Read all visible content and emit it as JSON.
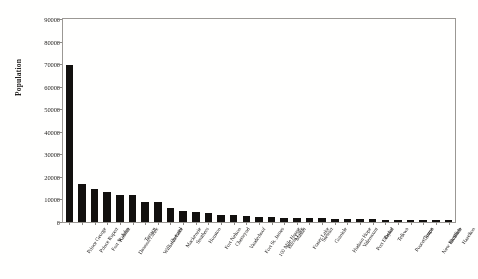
{
  "chart_data": {
    "type": "bar",
    "title": "",
    "xlabel": "",
    "ylabel": "Population",
    "ylim": [
      0,
      90000
    ],
    "yticks": [
      0,
      10000,
      20000,
      30000,
      40000,
      50000,
      60000,
      70000,
      80000,
      90000
    ],
    "grid": false,
    "legend": null,
    "bar_color": "#141210",
    "categories": [
      "Prince George",
      "Prince Rupert",
      "Fort St. John",
      "Kitimat",
      "Dawson Creek",
      "Terrace",
      "Williams Lake",
      "Quesnel",
      "Mackenzie",
      "Smithers",
      "Houston",
      "Fort Nelson",
      "Chetwynd",
      "Vanderhoof",
      "Fort St. James",
      "100 Mile House",
      "Burns Lake",
      "Masset",
      "Fraser Lake",
      "Stewart",
      "Granisle",
      "Hudson Hope",
      "Valemount",
      "Port Edward",
      "Taylor",
      "Telkwa",
      "Pouce Coupe",
      "Clinton",
      "New Hazelton",
      "McBride",
      "Hazelton"
    ],
    "values": [
      69500,
      16800,
      14600,
      13500,
      12000,
      11800,
      9000,
      8900,
      6300,
      5100,
      4300,
      4200,
      3100,
      2900,
      2500,
      2300,
      2200,
      2000,
      1800,
      1700,
      1600,
      1400,
      1300,
      1200,
      1150,
      1100,
      1000,
      900,
      850,
      800,
      700
    ]
  }
}
